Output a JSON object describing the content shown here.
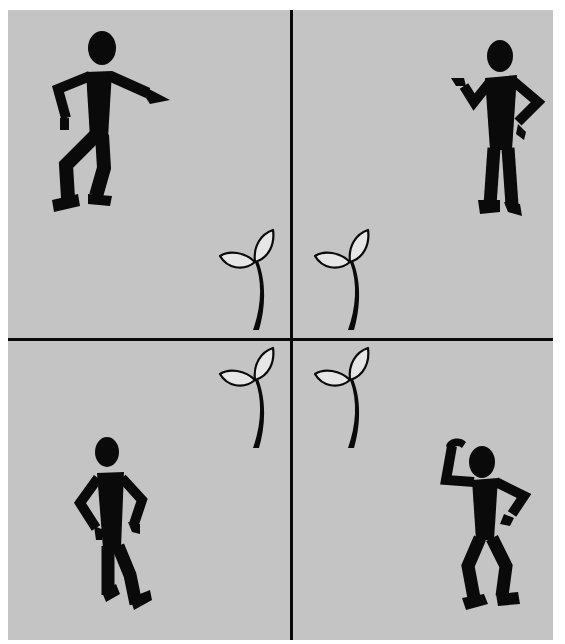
{
  "figure": {
    "colors": {
      "background": "#ffffff",
      "panel": "#c4c4c4",
      "ink": "#0a0a0a",
      "leaf_fill": "#e6e6e6"
    },
    "quadrants": [
      {
        "position": "top-left",
        "figure_pose": "pointing toward the sprout",
        "icon": "stick-figure-pointing-icon"
      },
      {
        "position": "top-right",
        "figure_pose": "gesturing with open hand, other hand on hip",
        "icon": "stick-figure-gesturing-icon"
      },
      {
        "position": "bottom-left",
        "figure_pose": "standing with both hands on hips",
        "icon": "stick-figure-hands-on-hips-icon"
      },
      {
        "position": "bottom-right",
        "figure_pose": "scratching head, hand on hip",
        "icon": "stick-figure-scratching-head-icon"
      }
    ],
    "sprouts": [
      {
        "position": "top-left",
        "icon": "sprout-icon"
      },
      {
        "position": "top-right",
        "icon": "sprout-icon"
      },
      {
        "position": "bottom-left",
        "icon": "sprout-icon"
      },
      {
        "position": "bottom-right",
        "icon": "sprout-icon"
      }
    ]
  }
}
